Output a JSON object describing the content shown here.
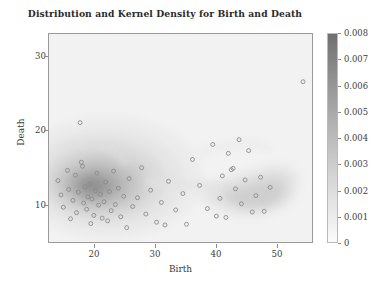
{
  "chart_data": {
    "type": "scatter",
    "title": "Distribution and Kernel Density for Birth and Death",
    "xlabel": "Birth",
    "ylabel": "Death",
    "xlim": [
      13,
      57
    ],
    "ylim": [
      2.5,
      33
    ],
    "xticks": [
      20,
      30,
      40,
      50
    ],
    "xtick_labels": [
      "20",
      "30",
      "40",
      "50"
    ],
    "yticks": [
      10,
      20,
      30
    ],
    "ytick_labels": [
      "10",
      "20",
      "30"
    ],
    "grid": false,
    "legend": false,
    "overlay": "kernel-density-contour",
    "colorbar": {
      "label": "",
      "ticks": [
        0,
        0.001,
        0.002,
        0.003,
        0.004,
        0.005,
        0.006,
        0.007,
        0.008
      ],
      "tick_labels": [
        "0",
        "0.001",
        "0.002",
        "0.003",
        "0.004",
        "0.005",
        "0.006",
        "0.007",
        "0.008"
      ],
      "vmin": 0,
      "vmax": 0.008,
      "colormap": "grayscale-reversed",
      "low_color": "#fbfbfb",
      "high_color": "#6f6f6f"
    },
    "marker": {
      "shape": "circle-open",
      "size": 4,
      "edge_color": "#8a8a8a",
      "face_color": "none"
    },
    "points": [
      {
        "x": 14.5,
        "y": 11.5
      },
      {
        "x": 15.0,
        "y": 9.4
      },
      {
        "x": 15.4,
        "y": 7.6
      },
      {
        "x": 16.1,
        "y": 13.0
      },
      {
        "x": 16.3,
        "y": 10.2
      },
      {
        "x": 16.6,
        "y": 5.9
      },
      {
        "x": 17.0,
        "y": 8.6
      },
      {
        "x": 17.4,
        "y": 12.3
      },
      {
        "x": 17.6,
        "y": 6.8
      },
      {
        "x": 17.9,
        "y": 9.8
      },
      {
        "x": 18.2,
        "y": 20.0
      },
      {
        "x": 18.4,
        "y": 14.2
      },
      {
        "x": 18.6,
        "y": 13.6
      },
      {
        "x": 18.8,
        "y": 8.2
      },
      {
        "x": 19.0,
        "y": 10.6
      },
      {
        "x": 19.3,
        "y": 7.3
      },
      {
        "x": 19.5,
        "y": 9.1
      },
      {
        "x": 19.8,
        "y": 11.0
      },
      {
        "x": 20.0,
        "y": 5.2
      },
      {
        "x": 20.2,
        "y": 8.8
      },
      {
        "x": 20.5,
        "y": 6.4
      },
      {
        "x": 20.8,
        "y": 10.0
      },
      {
        "x": 21.0,
        "y": 12.6
      },
      {
        "x": 21.3,
        "y": 7.9
      },
      {
        "x": 21.6,
        "y": 9.5
      },
      {
        "x": 21.9,
        "y": 6.0
      },
      {
        "x": 22.2,
        "y": 8.4
      },
      {
        "x": 22.5,
        "y": 11.3
      },
      {
        "x": 22.8,
        "y": 5.6
      },
      {
        "x": 23.1,
        "y": 9.9
      },
      {
        "x": 23.4,
        "y": 7.1
      },
      {
        "x": 23.8,
        "y": 12.9
      },
      {
        "x": 24.1,
        "y": 8.0
      },
      {
        "x": 24.6,
        "y": 10.4
      },
      {
        "x": 25.0,
        "y": 6.2
      },
      {
        "x": 25.5,
        "y": 9.2
      },
      {
        "x": 26.0,
        "y": 4.6
      },
      {
        "x": 26.4,
        "y": 11.8
      },
      {
        "x": 27.0,
        "y": 7.7
      },
      {
        "x": 27.8,
        "y": 9.0
      },
      {
        "x": 28.5,
        "y": 13.4
      },
      {
        "x": 29.2,
        "y": 6.6
      },
      {
        "x": 30.0,
        "y": 10.1
      },
      {
        "x": 31.0,
        "y": 5.4
      },
      {
        "x": 31.8,
        "y": 8.3
      },
      {
        "x": 32.4,
        "y": 5.0
      },
      {
        "x": 33.0,
        "y": 11.4
      },
      {
        "x": 34.2,
        "y": 7.2
      },
      {
        "x": 35.4,
        "y": 9.6
      },
      {
        "x": 36.0,
        "y": 5.1
      },
      {
        "x": 37.0,
        "y": 14.6
      },
      {
        "x": 38.2,
        "y": 10.8
      },
      {
        "x": 39.5,
        "y": 7.4
      },
      {
        "x": 40.4,
        "y": 16.8
      },
      {
        "x": 41.0,
        "y": 6.3
      },
      {
        "x": 41.6,
        "y": 8.9
      },
      {
        "x": 42.0,
        "y": 12.2
      },
      {
        "x": 42.6,
        "y": 6.1
      },
      {
        "x": 43.0,
        "y": 15.5
      },
      {
        "x": 43.5,
        "y": 13.1
      },
      {
        "x": 43.8,
        "y": 13.3
      },
      {
        "x": 44.2,
        "y": 10.3
      },
      {
        "x": 44.8,
        "y": 17.5
      },
      {
        "x": 45.2,
        "y": 8.1
      },
      {
        "x": 45.8,
        "y": 11.6
      },
      {
        "x": 46.4,
        "y": 15.9
      },
      {
        "x": 47.0,
        "y": 6.9
      },
      {
        "x": 47.6,
        "y": 9.3
      },
      {
        "x": 48.4,
        "y": 12.0
      },
      {
        "x": 49.0,
        "y": 7.0
      },
      {
        "x": 50.0,
        "y": 10.5
      },
      {
        "x": 55.5,
        "y": 26.0
      }
    ],
    "density_peak": {
      "x": 20.5,
      "y": 8.8,
      "value": 0.008
    },
    "secondary_lobe": {
      "x": 44.5,
      "y": 11.5,
      "value": 0.0022
    }
  },
  "figure": {
    "background_color": "#ffffff",
    "axes_face_color": "#f2f2f2",
    "frame_color": "#9a9a9a",
    "text_color": "#3b3b3b"
  }
}
